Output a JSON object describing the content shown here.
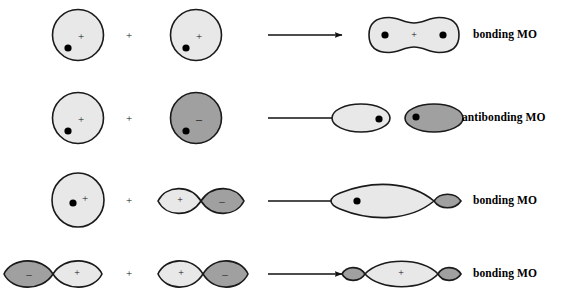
{
  "figure": {
    "title": "Orbital combination diagram for molecular orbitals",
    "background_color": "#ffffff",
    "colors": {
      "lobe_positive_fill": "#e8e8e8",
      "lobe_negative_fill": "#a0a0a0",
      "outline": "#1a1a1a",
      "nucleus": "#000000",
      "text": "#000000"
    },
    "signs": {
      "positive": "+",
      "negative": "–"
    },
    "operator": "+",
    "arrow": "→"
  },
  "rows": [
    {
      "id": "row-1",
      "result_label": "bonding MO",
      "reactants": [
        {
          "type": "s-orbital",
          "shape": "circle",
          "phase": "positive",
          "sign": "+",
          "fill": "#e8e8e8",
          "has_nucleus": true
        },
        {
          "type": "s-orbital",
          "shape": "circle",
          "phase": "positive",
          "sign": "+",
          "fill": "#e8e8e8",
          "has_nucleus": true
        }
      ],
      "product": {
        "type": "sigma-bonding",
        "shape": "peanut",
        "sign": "+",
        "fill": "#e8e8e8",
        "nuclei": 2
      }
    },
    {
      "id": "row-2",
      "result_label": "antibonding MO",
      "reactants": [
        {
          "type": "s-orbital",
          "shape": "circle",
          "phase": "positive",
          "sign": "+",
          "fill": "#e8e8e8",
          "has_nucleus": true
        },
        {
          "type": "s-orbital",
          "shape": "circle",
          "phase": "negative",
          "sign": "–",
          "fill": "#a0a0a0",
          "has_nucleus": true
        }
      ],
      "product": {
        "type": "sigma-antibonding",
        "shape": "two-separate-ellipses",
        "sign": "",
        "fill_left": "#e8e8e8",
        "fill_right": "#a0a0a0",
        "nuclei": 2
      }
    },
    {
      "id": "row-3",
      "result_label": "bonding MO",
      "reactants": [
        {
          "type": "s-orbital",
          "shape": "circle",
          "phase": "positive",
          "sign": "+",
          "fill": "#e8e8e8",
          "has_nucleus": true
        },
        {
          "type": "p-orbital",
          "shape": "two-lobes",
          "sign_left": "+",
          "sign_right": "–",
          "fill_left": "#e8e8e8",
          "fill_right": "#a0a0a0",
          "has_nucleus": false
        }
      ],
      "product": {
        "type": "sp-bonding",
        "shape": "large-lobe-small-lobe",
        "sign": "",
        "fill_large": "#e8e8e8",
        "fill_small": "#a0a0a0",
        "nuclei": 1
      }
    },
    {
      "id": "row-4",
      "result_label": "bonding MO",
      "reactants": [
        {
          "type": "p-orbital",
          "shape": "two-lobes",
          "sign_left": "–",
          "sign_right": "+",
          "fill_left": "#a0a0a0",
          "fill_right": "#e8e8e8",
          "has_nucleus": false
        },
        {
          "type": "p-orbital",
          "shape": "two-lobes",
          "sign_left": "+",
          "sign_right": "–",
          "fill_left": "#e8e8e8",
          "fill_right": "#a0a0a0",
          "has_nucleus": false
        }
      ],
      "product": {
        "type": "pi-sigma-bonding",
        "shape": "small-large-small-lobes",
        "sign": "+",
        "fill_large": "#e8e8e8",
        "fill_small": "#a0a0a0",
        "nuclei": 0
      }
    }
  ]
}
